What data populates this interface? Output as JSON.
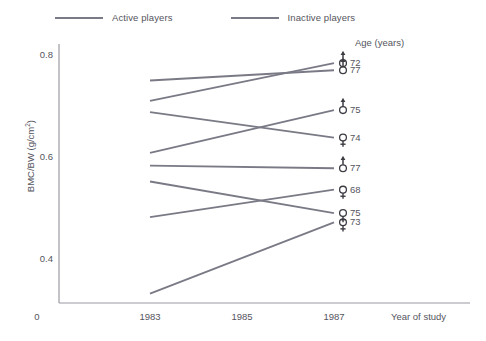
{
  "legend": {
    "items": [
      {
        "label": "Active players",
        "color": "#7a7a86",
        "key": "active"
      },
      {
        "label": "Inactive players",
        "color": "#7a7a86",
        "key": "inactive"
      }
    ]
  },
  "axes": {
    "y_title": "BMC/BW (g/cm",
    "y_title_sup": "2",
    "y_title_tail": ")",
    "y_ticks": [
      "0.8",
      "0.6",
      "0.4"
    ],
    "origin_label": "0",
    "x_ticks": [
      "1983",
      "1985",
      "1987"
    ],
    "x_title": "Year of study"
  },
  "annotations": {
    "age_header": "Age (years)"
  },
  "chart_data": {
    "type": "line",
    "title": "",
    "xlabel": "Year of study",
    "ylabel": "BMC/BW (g/cm2)",
    "x": [
      1983,
      1987
    ],
    "xlim": [
      1982.2,
      1987.6
    ],
    "ylim": [
      0.28,
      0.82
    ],
    "yticks": [
      0.4,
      0.6,
      0.8
    ],
    "xticks": [
      1983,
      1985,
      1987
    ],
    "grid": false,
    "legend_position": "top-left",
    "series": [
      {
        "name": "Active player, male, age 72",
        "group": "active",
        "sex": "male",
        "age": "72",
        "values": [
          0.71,
          0.784
        ],
        "color": "#7a7a86"
      },
      {
        "name": "Active player, male, age 77",
        "group": "active",
        "sex": "male",
        "age": "77",
        "values": [
          0.75,
          0.77
        ],
        "color": "#7a7a86"
      },
      {
        "name": "Active player, male, age 75",
        "group": "active",
        "sex": "male",
        "age": "75",
        "values": [
          0.608,
          0.692
        ],
        "color": "#7a7a86"
      },
      {
        "name": "Inactive player, female, age 74",
        "group": "inactive",
        "sex": "female",
        "age": "74",
        "values": [
          0.688,
          0.638
        ],
        "color": "#7a7a86"
      },
      {
        "name": "Active player, male, age 77",
        "group": "active",
        "sex": "male",
        "age": "77",
        "values": [
          0.583,
          0.578
        ],
        "color": "#7a7a86"
      },
      {
        "name": "Active player, female, age 68",
        "group": "active",
        "sex": "female",
        "age": "68",
        "values": [
          0.482,
          0.536
        ],
        "color": "#7a7a86"
      },
      {
        "name": "Inactive player, female, age 75",
        "group": "inactive",
        "sex": "female",
        "age": "75",
        "values": [
          0.552,
          0.49
        ],
        "color": "#7a7a86"
      },
      {
        "name": "Inactive player, female, age 73",
        "group": "inactive",
        "sex": "female",
        "age": "73",
        "values": [
          0.332,
          0.472
        ],
        "color": "#7a7a86"
      }
    ]
  }
}
